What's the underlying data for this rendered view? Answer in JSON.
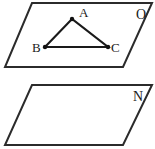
{
  "figure": {
    "background_color": "#ffffff",
    "line_color": "#2b2b2b",
    "triangle_color": "#1a1a1a",
    "label_color": "#1a1a1a",
    "width": 155,
    "height": 149
  },
  "planes": [
    {
      "id": "upper-plane",
      "label": "O",
      "label_x": 136,
      "label_y": 19,
      "corners": [
        {
          "x": 32,
          "y": 3
        },
        {
          "x": 152,
          "y": 3
        },
        {
          "x": 123,
          "y": 67
        },
        {
          "x": 5,
          "y": 67
        }
      ]
    },
    {
      "id": "lower-plane",
      "label": "N",
      "label_x": 133,
      "label_y": 101,
      "corners": [
        {
          "x": 32,
          "y": 85
        },
        {
          "x": 152,
          "y": 85
        },
        {
          "x": 123,
          "y": 145
        },
        {
          "x": 5,
          "y": 145
        }
      ]
    }
  ],
  "triangle": {
    "id": "triangle-ABC",
    "edges": "A-B, B-C, C-A",
    "vertices": [
      {
        "name": "A",
        "x": 72,
        "y": 19,
        "label": "A",
        "label_x": 79,
        "label_y": 17
      },
      {
        "name": "B",
        "x": 45,
        "y": 47,
        "label": "B",
        "label_x": 32,
        "label_y": 52
      },
      {
        "name": "C",
        "x": 108,
        "y": 47,
        "label": "C",
        "label_x": 111,
        "label_y": 52
      }
    ]
  }
}
